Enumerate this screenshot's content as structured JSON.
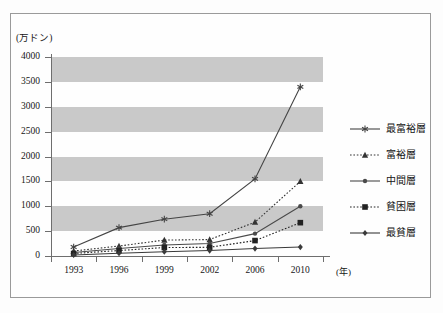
{
  "chart_data": {
    "type": "line",
    "title": "",
    "subtitle": "",
    "xlabel": "(年)",
    "ylabel": "(万ドン)",
    "x": [
      "1993",
      "1996",
      "1999",
      "2002",
      "2006",
      "2010"
    ],
    "categories": [
      "1993",
      "1996",
      "1999",
      "2002",
      "2006",
      "2010"
    ],
    "ylim": [
      0,
      4000
    ],
    "yticks": [
      0,
      500,
      1000,
      1500,
      2000,
      2500,
      3000,
      3500,
      4000
    ],
    "ytick_labels": [
      "0",
      "500",
      "1000",
      "1500",
      "2000",
      "2500",
      "3000",
      "3500",
      "4000"
    ],
    "grid": false,
    "banded_background": true,
    "band_color": "#c9c9c9",
    "legend_position": "right",
    "series": [
      {
        "name": "最富裕層",
        "marker": "asterisk",
        "linestyle": "solid",
        "color": "#444444",
        "values": [
          180,
          570,
          740,
          850,
          1550,
          3400
        ]
      },
      {
        "name": "富裕層",
        "marker": "triangle",
        "linestyle": "dotted",
        "color": "#333333",
        "values": [
          100,
          200,
          320,
          330,
          680,
          1500
        ]
      },
      {
        "name": "中間層",
        "marker": "dot",
        "linestyle": "solid",
        "color": "#4a4a4a",
        "values": [
          70,
          150,
          220,
          250,
          450,
          1000
        ]
      },
      {
        "name": "貧困層",
        "marker": "square",
        "linestyle": "dotted",
        "color": "#222222",
        "values": [
          50,
          110,
          170,
          175,
          310,
          670
        ]
      },
      {
        "name": "最貧層",
        "marker": "diamond",
        "linestyle": "solid",
        "color": "#3a3a3a",
        "values": [
          20,
          55,
          85,
          110,
          150,
          180
        ]
      }
    ]
  }
}
